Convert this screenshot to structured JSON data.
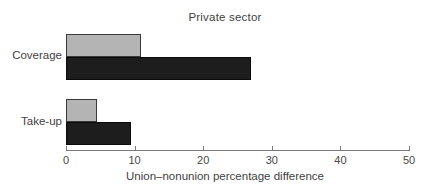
{
  "chart_data": {
    "type": "bar",
    "orientation": "horizontal",
    "title": "Private sector",
    "categories": [
      "Coverage",
      "Take-up"
    ],
    "series": [
      {
        "name": "gray",
        "color": "#b4b4b4",
        "border_color": "#3a3a3a",
        "values": [
          11,
          4.5
        ]
      },
      {
        "name": "black",
        "color": "#1d1d1d",
        "border_color": "#0a0a0a",
        "values": [
          27,
          9.5
        ]
      }
    ],
    "xlabel": "Union–nonunion percentage difference",
    "xlim": [
      0,
      50
    ],
    "xticks": [
      0,
      10,
      20,
      30,
      40,
      50
    ],
    "legend": "none",
    "grid": "off",
    "axis_color": "#7a7a7a"
  }
}
